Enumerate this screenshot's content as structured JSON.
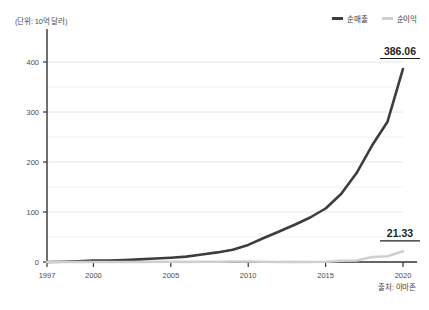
{
  "unit_label": "(단위: 10억 달러)",
  "source_note": "출처: 아마존",
  "legend": {
    "items": [
      {
        "label": "순매출",
        "color": "#3d3d3d"
      },
      {
        "label": "순이익",
        "color": "#cfcfcf"
      }
    ]
  },
  "annotations": [
    {
      "name": "net-sales-end-value",
      "text": "386.06"
    },
    {
      "name": "net-income-end-value",
      "text": "21.33"
    }
  ],
  "axis": {
    "y_ticks": [
      "0",
      "100",
      "200",
      "300",
      "400"
    ],
    "x_ticks": [
      "1997",
      "2000",
      "2005",
      "2010",
      "2015",
      "2020"
    ]
  },
  "chart_data": {
    "type": "line",
    "title": "",
    "subtitle": "",
    "xlabel": "",
    "ylabel": "(단위: 10억 달러)",
    "unit": "10억 달러",
    "source": "아마존",
    "grid": true,
    "legend_position": "top-right",
    "xlim": [
      1997,
      2020
    ],
    "ylim": [
      0,
      400
    ],
    "y_ticks": [
      0,
      100,
      200,
      300,
      400
    ],
    "y_minor_ticks": [
      50,
      150,
      250,
      350
    ],
    "x_ticks": [
      1997,
      2000,
      2005,
      2010,
      2015,
      2020
    ],
    "x": [
      1997,
      1998,
      1999,
      2000,
      2001,
      2002,
      2003,
      2004,
      2005,
      2006,
      2007,
      2008,
      2009,
      2010,
      2011,
      2012,
      2013,
      2014,
      2015,
      2016,
      2017,
      2018,
      2019,
      2020
    ],
    "series": [
      {
        "name": "순매출",
        "color": "#3d3d3d",
        "width": 2.6,
        "end_label": "386.06",
        "values": [
          0.15,
          0.61,
          1.64,
          2.76,
          3.12,
          3.93,
          5.26,
          6.92,
          8.49,
          10.71,
          14.84,
          19.17,
          24.51,
          34.2,
          48.08,
          61.09,
          74.45,
          88.99,
          107.01,
          135.99,
          177.87,
          232.89,
          280.52,
          386.06
        ]
      },
      {
        "name": "순이익",
        "color": "#cfcfcf",
        "width": 2.6,
        "end_label": "21.33",
        "values": [
          -0.03,
          -0.12,
          -0.72,
          -1.41,
          -0.57,
          -0.15,
          0.04,
          0.59,
          0.36,
          0.19,
          0.48,
          0.65,
          0.9,
          1.15,
          0.63,
          -0.04,
          0.27,
          -0.24,
          0.6,
          2.37,
          3.03,
          10.07,
          11.59,
          21.33
        ]
      }
    ]
  }
}
